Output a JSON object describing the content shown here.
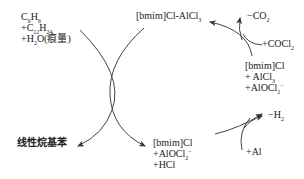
{
  "diagram": {
    "type": "catalytic-cycle",
    "nodes": {
      "reactants": {
        "line1": {
          "base": "C",
          "sub1": "6",
          "mid": "H",
          "sub2": "6"
        },
        "line2": {
          "prefix": "+C",
          "sub1": "12",
          "mid": "H",
          "sub2": "24"
        },
        "line3": {
          "prefix": "+H",
          "sub1": "2",
          "rest": "O(痕量)"
        }
      },
      "product": {
        "label": "线性烷基苯"
      },
      "catalyst_top": {
        "label": "[bmim]Cl-AlCl",
        "sub": "3"
      },
      "intermediate_bottom": {
        "line1": "[bmim]Cl",
        "line2": {
          "prefix": "+AlOCl",
          "sub": "2",
          "sup": "−"
        },
        "line3": "+HCl"
      },
      "intermediate_right": {
        "line1": "[bmim]Cl",
        "line2": {
          "prefix": "+ AlCl",
          "sub": "3"
        },
        "line3": {
          "prefix": "+AlOCl",
          "sub": "2",
          "sup": "−"
        }
      },
      "side_top_out": {
        "prefix": "−CO",
        "sub": "2"
      },
      "side_top_in": {
        "prefix": "+COCl",
        "sub": "2"
      },
      "side_bottom_out": {
        "prefix": "−H",
        "sub": "2"
      },
      "side_bottom_in": {
        "prefix": "+Al"
      }
    },
    "edges": [
      {
        "from": "reactants",
        "to": "product",
        "kind": "curved-arrow"
      },
      {
        "from": "catalyst_top",
        "to": "intermediate_bottom",
        "kind": "curved-arrow"
      },
      {
        "from": "intermediate_bottom",
        "to": "intermediate_right",
        "kind": "curved-arrow",
        "side_in": "+Al",
        "side_out": "−H2"
      },
      {
        "from": "intermediate_right",
        "to": "catalyst_top",
        "kind": "curved-arrow",
        "side_in": "+COCl2",
        "side_out": "−CO2"
      }
    ],
    "colors": {
      "line": "#333333",
      "text": "#222222",
      "background": "#ffffff"
    }
  }
}
